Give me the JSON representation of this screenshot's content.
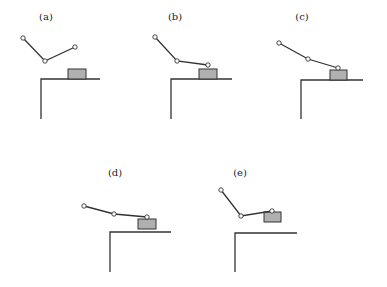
{
  "figure": {
    "panels": [
      {
        "label": "(a)",
        "label_pos": [
          46,
          20
        ],
        "joints": [
          [
            23,
            38
          ],
          [
            45,
            61
          ],
          [
            75,
            47
          ]
        ],
        "box": {
          "x": 68,
          "y": 69,
          "w": 18,
          "h": 10
        },
        "table": {
          "corner": [
            41,
            79
          ],
          "right_x": 100,
          "bottom_y": 119
        }
      },
      {
        "label": "(b)",
        "label_pos": [
          175,
          20
        ],
        "joints": [
          [
            155,
            37
          ],
          [
            177,
            61
          ],
          [
            208,
            65
          ]
        ],
        "box": {
          "x": 199,
          "y": 69,
          "w": 18,
          "h": 10
        },
        "table": {
          "corner": [
            171,
            79
          ],
          "right_x": 232,
          "bottom_y": 119
        }
      },
      {
        "label": "(c)",
        "label_pos": [
          302,
          20
        ],
        "joints": [
          [
            279,
            43
          ],
          [
            308,
            59
          ],
          [
            338,
            68
          ]
        ],
        "box": {
          "x": 330,
          "y": 70,
          "w": 17,
          "h": 10
        },
        "table": {
          "corner": [
            301,
            80
          ],
          "right_x": 363,
          "bottom_y": 119
        }
      },
      {
        "label": "(d)",
        "label_pos": [
          115,
          176
        ],
        "joints": [
          [
            84,
            206
          ],
          [
            114,
            214
          ],
          [
            147,
            217
          ]
        ],
        "box": {
          "x": 138,
          "y": 219,
          "w": 18,
          "h": 10
        },
        "table": {
          "corner": [
            110,
            232
          ],
          "right_x": 171,
          "bottom_y": 272
        }
      },
      {
        "label": "(e)",
        "label_pos": [
          240,
          176
        ],
        "joints": [
          [
            221,
            190
          ],
          [
            241,
            216
          ],
          [
            272,
            211
          ]
        ],
        "box": {
          "x": 264,
          "y": 212,
          "w": 17,
          "h": 10
        },
        "table": {
          "corner": [
            235,
            233
          ],
          "right_x": 297,
          "bottom_y": 272
        }
      }
    ],
    "colors": {
      "line": "#333333",
      "box_fill": "#b0b0b0",
      "joint_fill": "#ffffff"
    }
  }
}
